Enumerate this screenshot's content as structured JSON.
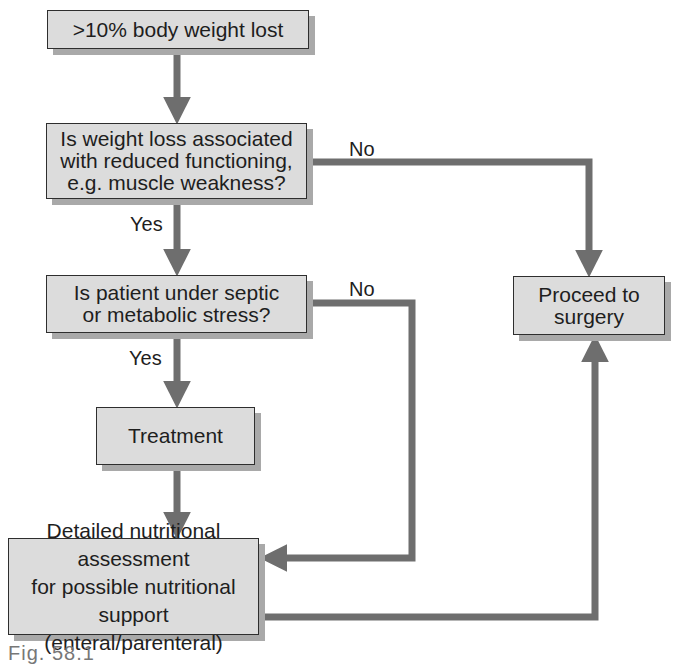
{
  "diagram": {
    "type": "flowchart",
    "colors": {
      "box_fill": "#dcdcdc",
      "box_border": "#2e2e2e",
      "box_shadow": "#a9a9a9",
      "arrow": "#6e6e6e",
      "text": "#1e1e1e"
    },
    "nodes": {
      "start": {
        "text": ">10% body weight lost"
      },
      "q_functioning": {
        "lines": [
          "Is weight loss associated",
          "with reduced functioning,",
          "e.g. muscle weakness?"
        ]
      },
      "q_stress": {
        "lines": [
          "Is patient under septic",
          "or metabolic stress?"
        ]
      },
      "treatment": {
        "text": "Treatment"
      },
      "assessment": {
        "lines": [
          "Detailed nutritional assessment",
          "for possible nutritional support",
          "(enteral/parenteral)"
        ]
      },
      "surgery": {
        "lines": [
          "Proceed to",
          "surgery"
        ]
      }
    },
    "edge_labels": {
      "functioning_no": "No",
      "functioning_yes": "Yes",
      "stress_no": "No",
      "stress_yes": "Yes"
    },
    "edges": [
      {
        "from": "start",
        "to": "q_functioning",
        "label": ""
      },
      {
        "from": "q_functioning",
        "to": "surgery",
        "label": "No"
      },
      {
        "from": "q_functioning",
        "to": "q_stress",
        "label": "Yes"
      },
      {
        "from": "q_stress",
        "to": "assessment",
        "label": "No"
      },
      {
        "from": "q_stress",
        "to": "treatment",
        "label": "Yes"
      },
      {
        "from": "treatment",
        "to": "assessment",
        "label": ""
      },
      {
        "from": "assessment",
        "to": "surgery",
        "label": ""
      }
    ]
  },
  "caption": "Fig. 58.1"
}
